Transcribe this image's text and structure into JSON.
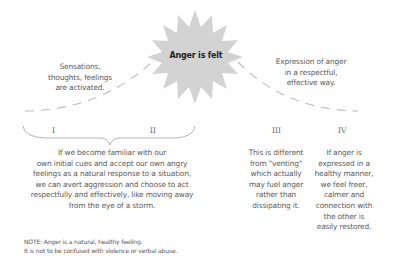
{
  "center": {
    "label": "Anger is felt",
    "fill": "#d3d3d3"
  },
  "left_caption": "Sensations,\nthoughts, feelings\nare activated.",
  "right_caption": "Expression of anger\nin a respectful,\neffective way.",
  "stages": [
    {
      "numeral": "I"
    },
    {
      "numeral": "II"
    },
    {
      "numeral": "III"
    },
    {
      "numeral": "IV"
    }
  ],
  "stage_I_II_text": "If we become familiar with our\nown initial cues and accept our own angry\nfeelings as a natural response to a situation,\nwe can avert aggression and choose to act\nrespectfully and effectively, like moving away\nfrom the eye of a storm.",
  "stage_III_text": "This is different\nfrom \"venting\"\nwhich actually\nmay fuel anger\nrather than\ndissipating it.",
  "stage_IV_text": "If anger is\nexpressed in a\nhealthy manner,\nwe feel freer,\ncalmer and\nconnection with\nthe other is\neasily restored.",
  "note": {
    "line1": "NOTE: Anger is a natural, healthy feeling.",
    "line2": "It is not to be confused with violence or verbal abuse."
  },
  "colors": {
    "text": "#5a5a5a",
    "line": "#bdbdbd",
    "burst": "#d3d3d3"
  }
}
